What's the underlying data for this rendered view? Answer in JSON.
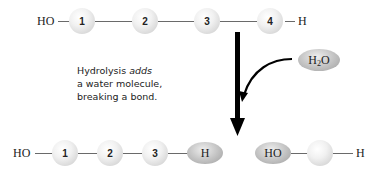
{
  "top_chain": {
    "left_end": "HO",
    "right_end": "H",
    "monomers": [
      "1",
      "2",
      "3",
      "4"
    ]
  },
  "water": {
    "label_main": "H",
    "label_sub": "2",
    "label_tail": "O"
  },
  "caption": {
    "line1_prefix": "Hydrolysis ",
    "line1_emph": "adds",
    "line2": "a water molecule,",
    "line3": "breaking a bond."
  },
  "bottom_left_chain": {
    "left_end": "HO",
    "monomers": [
      "1",
      "2",
      "3"
    ],
    "right_end_group": "H"
  },
  "bottom_right_chain": {
    "left_end_group": "HO",
    "monomer_label": "",
    "right_end": "H"
  },
  "colors": {
    "bond": "#6a6a6a",
    "arrow": "#000000",
    "text": "#222222"
  }
}
